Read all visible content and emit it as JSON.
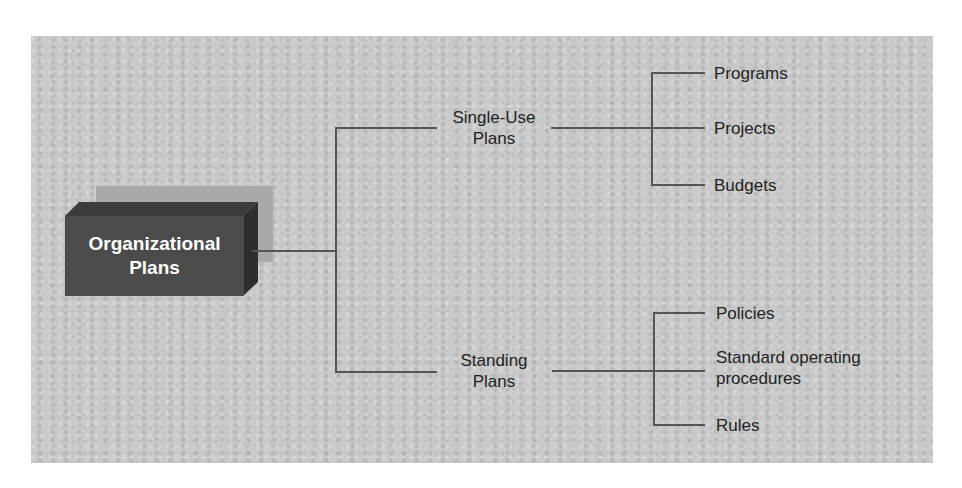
{
  "diagram": {
    "root": {
      "label_line1": "Organizational",
      "label_line2": "Plans"
    },
    "branches": [
      {
        "label_line1": "Single-Use",
        "label_line2": "Plans",
        "children": [
          "Programs",
          "Projects",
          "Budgets"
        ]
      },
      {
        "label_line1": "Standing",
        "label_line2": "Plans",
        "children": [
          "Policies",
          "Standard operating",
          "procedures",
          "Rules"
        ]
      }
    ],
    "standing_children_display": {
      "policies": "Policies",
      "sop_line1": "Standard operating",
      "sop_line2": "procedures",
      "rules": "Rules"
    }
  },
  "colors": {
    "panel_bg": "#c9c9c9",
    "box_front": "#4b4b4b",
    "box_shadow": "#a9a9a9",
    "line": "#555555",
    "text": "#222222"
  }
}
